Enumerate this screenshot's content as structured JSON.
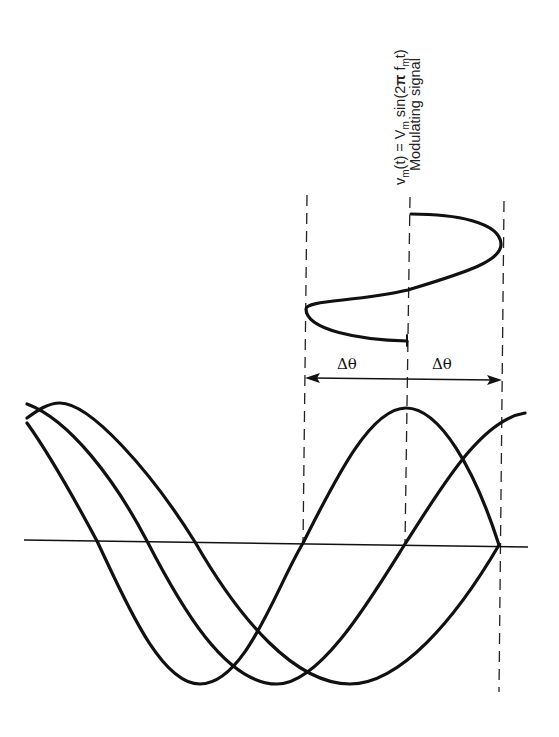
{
  "figure": {
    "type": "phase-modulation-diagram",
    "modulating_signal": {
      "formula_prefix": "v",
      "formula_sub1": "m",
      "formula_mid1": "(t) = V",
      "formula_sub2": "m",
      "formula_mid2": " sin(2",
      "formula_pi": "π",
      "formula_f": " f",
      "formula_sub3": "m",
      "formula_end": "t)",
      "formula_full": "vm(t) = Vm sin(2π fm t)",
      "caption": "Modulating signal"
    },
    "phase_deviation": {
      "left_label": "Δθ",
      "right_label": "Δθ"
    },
    "waves": {
      "count": 3,
      "description": "Carrier waveforms shifted by phase deviation ±Δθ"
    },
    "colors": {
      "stroke": "#111111",
      "background": "#ffffff"
    }
  }
}
